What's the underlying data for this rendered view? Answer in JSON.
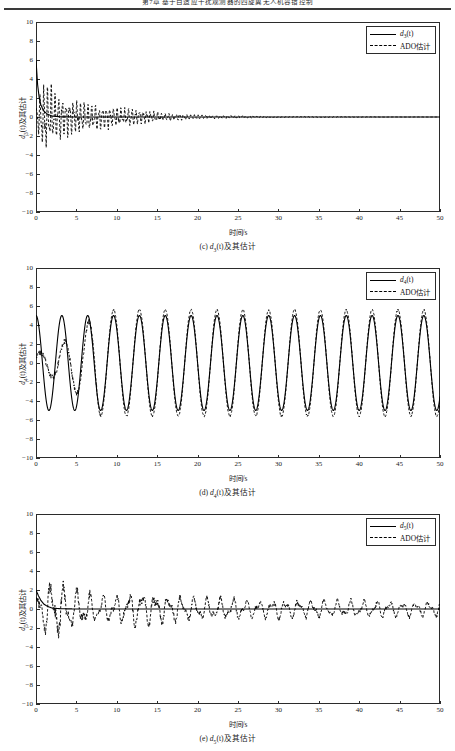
{
  "header": {
    "text": "第7章 基于自适应干扰观测器的四旋翼无人机容错控制"
  },
  "figures": [
    {
      "id": "fig-c",
      "caption_prefix": "(c) ",
      "caption_var": "d",
      "caption_sub": "3",
      "caption_suffix": "(t)及其估计",
      "ylabel_var": "d",
      "ylabel_sub": "3",
      "ylabel_suffix": "(t)及其估计",
      "xlabel": "时间/s",
      "legend": [
        {
          "style": "solid",
          "var": "d",
          "sub": "3",
          "suffix": "(t)"
        },
        {
          "style": "dashed",
          "text": "ADO估计"
        }
      ],
      "chart_data": {
        "type": "line",
        "title": "(c) d3(t)及其估计",
        "xlabel": "时间/s",
        "ylabel": "d3(t)及其估计",
        "xlim": [
          0,
          50
        ],
        "ylim": [
          -10,
          10
        ],
        "xticks": [
          0,
          5,
          10,
          15,
          20,
          25,
          30,
          35,
          40,
          45,
          50
        ],
        "yticks": [
          -10,
          -8,
          -6,
          -4,
          -2,
          0,
          2,
          4,
          6,
          8,
          10
        ],
        "grid": false,
        "legend_position": "top-right",
        "series": [
          {
            "name": "d3(t)",
            "style": "solid",
            "description": "starts near 6 at t=0, decays rapidly to 0 by t~2, then flat at 0 through t=50",
            "x": [
              0,
              0.2,
              0.4,
              0.6,
              0.8,
              1.0,
              1.4,
              2.0,
              3.0,
              5.0,
              10.0,
              20.0,
              30.0,
              40.0,
              50.0
            ],
            "y": [
              6.0,
              3.4,
              2.0,
              1.3,
              0.9,
              0.6,
              0.3,
              0.1,
              0.02,
              0.0,
              0.0,
              0.0,
              0.0,
              0.0,
              0.0
            ]
          },
          {
            "name": "ADO估计",
            "style": "dashed",
            "description": "high-frequency oscillation about 0, peak amplitude ~4 near t=1.5, decaying envelope to ~0.1 by t=20, flat thereafter",
            "envelope_x": [
              0,
              1.0,
              1.5,
              2.5,
              4.0,
              6.0,
              8.0,
              10.0,
              13.0,
              16.0,
              20.0,
              30.0,
              50.0
            ],
            "envelope_y": [
              1.0,
              3.8,
              4.0,
              2.6,
              2.0,
              1.5,
              1.2,
              1.0,
              0.7,
              0.4,
              0.2,
              0.05,
              0.0
            ]
          }
        ]
      }
    },
    {
      "id": "fig-d",
      "caption_prefix": "(d) ",
      "caption_var": "d",
      "caption_sub": "4",
      "caption_suffix": "(t)及其估计",
      "ylabel_var": "d",
      "ylabel_sub": "4",
      "ylabel_suffix": "(t)及其估计",
      "xlabel": "时间/s",
      "legend": [
        {
          "style": "solid",
          "var": "d",
          "sub": "4",
          "suffix": "(t)"
        },
        {
          "style": "dashed",
          "text": "ADO估计"
        }
      ],
      "chart_data": {
        "type": "line",
        "title": "(d) d4(t)及其估计",
        "xlabel": "时间/s",
        "ylabel": "d4(t)及其估计",
        "xlim": [
          0,
          50
        ],
        "ylim": [
          -10,
          10
        ],
        "xticks": [
          0,
          5,
          10,
          15,
          20,
          25,
          30,
          35,
          40,
          45,
          50
        ],
        "yticks": [
          -10,
          -8,
          -6,
          -4,
          -2,
          0,
          2,
          4,
          6,
          8,
          10
        ],
        "grid": false,
        "legend_position": "top-right",
        "series": [
          {
            "name": "d4(t)",
            "style": "solid",
            "description": "sinusoid amplitude 5, period ~3.2 s, starts near +5 at t=0",
            "amplitude": 5.0,
            "period": 3.2,
            "phase_deg": 90,
            "offset": 0.0
          },
          {
            "name": "ADO估计",
            "style": "dashed",
            "description": "tracks the sinusoid; transient with reduced amplitude (~1-2) for t<5, converges to amplitude ~5.6 with slight overshoot at peaks after t~8",
            "amplitude": 5.6,
            "period": 3.2,
            "phase_deg": 90,
            "convergence_time": 8.0
          }
        ]
      }
    },
    {
      "id": "fig-e",
      "caption_prefix": "(e) ",
      "caption_var": "d",
      "caption_sub": "5",
      "caption_suffix": "(t)及其估计",
      "ylabel_var": "d",
      "ylabel_sub": "5",
      "ylabel_suffix": "(t)及其估计",
      "xlabel": "时间/s",
      "legend": [
        {
          "style": "solid",
          "var": "d",
          "sub": "5",
          "suffix": "(t)"
        },
        {
          "style": "dashed",
          "text": "ADO估计"
        }
      ],
      "chart_data": {
        "type": "line",
        "title": "(e) d5(t)及其估计",
        "xlabel": "时间/s",
        "ylabel": "d5(t)及其估计",
        "xlim": [
          0,
          50
        ],
        "ylim": [
          -10,
          10
        ],
        "xticks": [
          0,
          5,
          10,
          15,
          20,
          25,
          30,
          35,
          40,
          45,
          50
        ],
        "yticks": [
          -10,
          -8,
          -6,
          -4,
          -2,
          0,
          2,
          4,
          6,
          8,
          10
        ],
        "grid": false,
        "legend_position": "top-right",
        "series": [
          {
            "name": "d5(t)",
            "style": "solid",
            "description": "starts at 2 at t=0, decays exponentially to 0 by t~2, flat at 0 afterwards",
            "x": [
              0,
              0.3,
              0.6,
              1.0,
              1.5,
              2.0,
              3.0,
              5.0,
              10.0,
              20.0,
              30.0,
              40.0,
              50.0
            ],
            "y": [
              2.0,
              1.4,
              0.9,
              0.5,
              0.25,
              0.1,
              0.03,
              0.0,
              0.0,
              0.0,
              0.0,
              0.0,
              0.0
            ]
          },
          {
            "name": "ADO估计",
            "style": "dashed",
            "description": "oscillates about 0 with peak ~+3.2 near t=2.3 and trough ~-2.5 near t=3.5, then irregular oscillation with amplitude ~1-2 decaying slowly to ~0.8 by t=50",
            "envelope_x": [
              0,
              2.3,
              3.5,
              5.0,
              8.0,
              10.0,
              13.0,
              16.0,
              20.0,
              30.0,
              40.0,
              50.0
            ],
            "envelope_y": [
              1.5,
              3.2,
              2.5,
              2.0,
              1.3,
              1.4,
              1.8,
              1.5,
              1.2,
              1.0,
              0.9,
              0.8
            ]
          }
        ]
      }
    }
  ]
}
